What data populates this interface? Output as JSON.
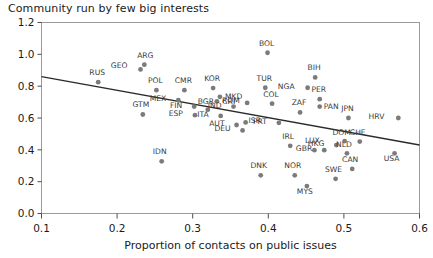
{
  "chart_data": {
    "type": "scatter",
    "title": "Community run by few big interests",
    "xlabel": "Proportion of contacts on public issues",
    "ylabel": "",
    "xlim": [
      0.1,
      0.6
    ],
    "ylim": [
      0.0,
      1.2
    ],
    "xticks": [
      "0.1",
      "0.2",
      "0.3",
      "0.4",
      "0.5",
      "0.6"
    ],
    "xtick_values": [
      0.1,
      0.2,
      0.3,
      0.4,
      0.5,
      0.6
    ],
    "yticks": [
      "0.0",
      "0.2",
      "0.4",
      "0.6",
      "0.8",
      "1.0",
      "1.2"
    ],
    "ytick_values": [
      0.0,
      0.2,
      0.4,
      0.6,
      0.8,
      1.0,
      1.2
    ],
    "grid": false,
    "legend": "none",
    "trendline": {
      "x_start": 0.1,
      "y_start": 0.86,
      "x_end": 0.6,
      "y_end": 0.43
    },
    "points": [
      {
        "label": "RUS",
        "x": 0.175,
        "y": 0.825,
        "lx": -1,
        "ly": -7
      },
      {
        "label": "GEO",
        "x": 0.231,
        "y": 0.905,
        "lx": -13,
        "ly": -1
      },
      {
        "label": "ARG",
        "x": 0.236,
        "y": 0.935,
        "lx": 1,
        "ly": -7
      },
      {
        "label": "POL",
        "x": 0.252,
        "y": 0.775,
        "lx": -1,
        "ly": -7
      },
      {
        "label": "GTM",
        "x": 0.234,
        "y": 0.622,
        "lx": -2,
        "ly": -7
      },
      {
        "label": "CMR",
        "x": 0.289,
        "y": 0.775,
        "lx": -1,
        "ly": -7
      },
      {
        "label": "MEX",
        "x": 0.281,
        "y": 0.712,
        "lx": -12,
        "ly": 1
      },
      {
        "label": "FIN",
        "x": 0.302,
        "y": 0.672,
        "lx": -12,
        "ly": 1
      },
      {
        "label": "KOR",
        "x": 0.327,
        "y": 0.788,
        "lx": -1,
        "ly": -7
      },
      {
        "label": "MKD",
        "x": 0.336,
        "y": 0.733,
        "lx": 5,
        "ly": 2
      },
      {
        "label": "ROM",
        "x": 0.332,
        "y": 0.705,
        "lx": 5,
        "ly": 2
      },
      {
        "label": "BGR",
        "x": 0.32,
        "y": 0.652,
        "lx": -2,
        "ly": -6
      },
      {
        "label": "ESP",
        "x": 0.303,
        "y": 0.618,
        "lx": -12,
        "ly": 1
      },
      {
        "label": "ITA",
        "x": 0.337,
        "y": 0.613,
        "lx": -12,
        "ly": 1
      },
      {
        "label": "IDN",
        "x": 0.259,
        "y": 0.328,
        "lx": -2,
        "ly": -7
      },
      {
        "label": "IND",
        "x": 0.354,
        "y": 0.672,
        "lx": -12,
        "ly": 1
      },
      {
        "label": "CRI",
        "x": 0.372,
        "y": 0.695,
        "lx": -12,
        "ly": 1
      },
      {
        "label": "AUT",
        "x": 0.358,
        "y": 0.556,
        "lx": -12,
        "ly": 1
      },
      {
        "label": "ISR",
        "x": 0.37,
        "y": 0.572,
        "lx": 3,
        "ly": 1
      },
      {
        "label": "DEU",
        "x": 0.366,
        "y": 0.522,
        "lx": -12,
        "ly": 1
      },
      {
        "label": "BOL",
        "x": 0.399,
        "y": 1.01,
        "lx": -1,
        "ly": -7
      },
      {
        "label": "TUR",
        "x": 0.396,
        "y": 0.79,
        "lx": -1,
        "ly": -7
      },
      {
        "label": "COL",
        "x": 0.405,
        "y": 0.69,
        "lx": -1,
        "ly": -7
      },
      {
        "label": "PRT",
        "x": 0.414,
        "y": 0.57,
        "lx": -12,
        "ly": 1
      },
      {
        "label": "DNK",
        "x": 0.39,
        "y": 0.24,
        "lx": -2,
        "ly": -7
      },
      {
        "label": "IRL",
        "x": 0.429,
        "y": 0.425,
        "lx": -2,
        "ly": -7
      },
      {
        "label": "NOR",
        "x": 0.435,
        "y": 0.24,
        "lx": -2,
        "ly": -7
      },
      {
        "label": "MYS",
        "x": 0.451,
        "y": 0.172,
        "lx": -2,
        "ly": 8
      },
      {
        "label": "NGA",
        "x": 0.452,
        "y": 0.79,
        "lx": -13,
        "ly": 1
      },
      {
        "label": "ZAF",
        "x": 0.442,
        "y": 0.635,
        "lx": -1,
        "ly": -7
      },
      {
        "label": "BIH",
        "x": 0.462,
        "y": 0.855,
        "lx": -1,
        "ly": -7
      },
      {
        "label": "PER",
        "x": 0.468,
        "y": 0.718,
        "lx": -1,
        "ly": -7
      },
      {
        "label": "PAN",
        "x": 0.468,
        "y": 0.672,
        "lx": 4,
        "ly": 2
      },
      {
        "label": "LUX",
        "x": 0.461,
        "y": 0.398,
        "lx": -2,
        "ly": -7
      },
      {
        "label": "GBR",
        "x": 0.474,
        "y": 0.398,
        "lx": -12,
        "ly": 1
      },
      {
        "label": "HKG",
        "x": 0.49,
        "y": 0.43,
        "lx": -12,
        "ly": 1
      },
      {
        "label": "DOM",
        "x": 0.501,
        "y": 0.455,
        "lx": -3,
        "ly": -6
      },
      {
        "label": "NLD",
        "x": 0.504,
        "y": 0.378,
        "lx": -3,
        "ly": -6
      },
      {
        "label": "SWE",
        "x": 0.489,
        "y": 0.218,
        "lx": -2,
        "ly": -7
      },
      {
        "label": "CAN",
        "x": 0.511,
        "y": 0.28,
        "lx": -2,
        "ly": -7
      },
      {
        "label": "JPN",
        "x": 0.506,
        "y": 0.6,
        "lx": -1,
        "ly": -7
      },
      {
        "label": "CHE",
        "x": 0.521,
        "y": 0.452,
        "lx": -2,
        "ly": -7
      },
      {
        "label": "HRV",
        "x": 0.572,
        "y": 0.6,
        "lx": -14,
        "ly": 1
      },
      {
        "label": "USA",
        "x": 0.567,
        "y": 0.378,
        "lx": -3,
        "ly": 8
      }
    ]
  }
}
